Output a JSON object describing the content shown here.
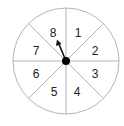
{
  "spinner": {
    "sections": [
      {
        "label": "1"
      },
      {
        "label": "2"
      },
      {
        "label": "3"
      },
      {
        "label": "4"
      },
      {
        "label": "5"
      },
      {
        "label": "6"
      },
      {
        "label": "7"
      },
      {
        "label": "8"
      }
    ],
    "arrow_pointing_to": "8",
    "colors": {
      "outline": "#b5b5b5",
      "divider": "#b5b5b5",
      "hub": "#000000",
      "arrow": "#111111",
      "text": "#222222"
    }
  }
}
